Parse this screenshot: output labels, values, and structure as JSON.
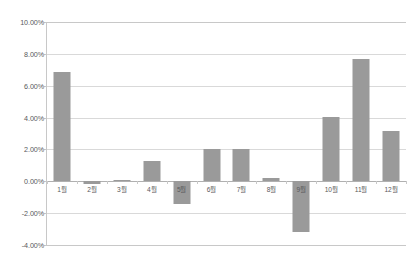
{
  "chart_data": {
    "type": "bar",
    "title": "",
    "xlabel": "",
    "ylabel": "",
    "categories": [
      "1월",
      "2월",
      "3월",
      "4월",
      "5월",
      "6월",
      "7월",
      "8월",
      "9월",
      "10월",
      "11월",
      "12월"
    ],
    "values": [
      6.85,
      -0.2,
      0.1,
      1.3,
      -1.4,
      2.05,
      2.05,
      0.2,
      -3.2,
      4.05,
      7.7,
      3.15
    ],
    "value_labels": [
      "6.85%",
      "-0.20%",
      "0.10%",
      "1.30%",
      "-1.40%",
      "2.05%",
      "2.05%",
      "0.20%",
      "-3.20%",
      "4.05%",
      "7.70%",
      "3.15%"
    ],
    "ylim": [
      -4.0,
      10.0
    ],
    "ytick_values": [
      10.0,
      8.0,
      6.0,
      4.0,
      2.0,
      0.0,
      -2.0,
      -4.0
    ],
    "ytick_labels": [
      "10.00%",
      "8.00%",
      "6.00%",
      "4.00%",
      "2.00%",
      "0.00%",
      "-2.00%",
      "-4.00%"
    ],
    "grid": true,
    "legend": false,
    "legend_position": "none",
    "series_name": "",
    "bar_color": "#9a9a9a",
    "grid_color": "#d9d9d9",
    "axis_color": "#c8c8c8",
    "zero_line_color": "#b0b0b0",
    "text_color": "#58595b",
    "background_color": "#ffffff"
  }
}
